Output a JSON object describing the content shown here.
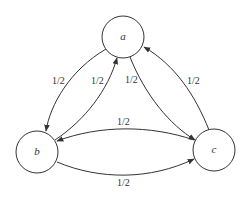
{
  "diagram": {
    "type": "directed-graph",
    "nodes": [
      {
        "id": "a",
        "label": "a"
      },
      {
        "id": "b",
        "label": "b"
      },
      {
        "id": "c",
        "label": "c"
      }
    ],
    "edges": [
      {
        "from": "a",
        "to": "b",
        "label": "1/2"
      },
      {
        "from": "b",
        "to": "a",
        "label": "1/2"
      },
      {
        "from": "a",
        "to": "c",
        "label": "1/2"
      },
      {
        "from": "c",
        "to": "a",
        "label": "1/2"
      },
      {
        "from": "c",
        "to": "b",
        "label": "1/2"
      },
      {
        "from": "b",
        "to": "c",
        "label": "1/2"
      }
    ]
  }
}
